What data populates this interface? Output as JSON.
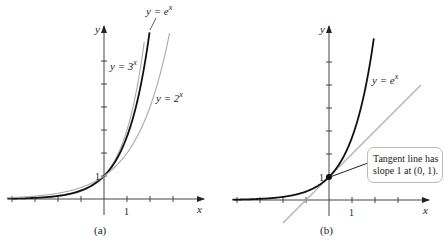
{
  "chart_data": [
    {
      "type": "line",
      "panel_label": "(a)",
      "xlabel": "x",
      "ylabel": "y",
      "x_tick_label": "1",
      "y_tick_label": "1",
      "xlim": [
        -4,
        3
      ],
      "ylim": [
        0,
        6.5
      ],
      "x_ticks": [
        -4,
        -3,
        -2,
        -1,
        1,
        2,
        3
      ],
      "y_ticks": [
        1,
        2,
        3,
        4,
        5,
        6
      ],
      "grid": false,
      "series": [
        {
          "name": "y = 3^x",
          "label_text": "y = 3",
          "label_sup": "x",
          "base": 3,
          "color": "#aaaaaa",
          "x_range": [
            -4.2,
            1.75
          ]
        },
        {
          "name": "y = e^x",
          "label_text": "y = e",
          "label_sup": "x",
          "base": 2.718281828,
          "color": "#111111",
          "x_range": [
            -4.2,
            1.98
          ]
        },
        {
          "name": "y = 2^x",
          "label_text": "y = 2",
          "label_sup": "x",
          "base": 2,
          "color": "#aaaaaa",
          "x_range": [
            -4.2,
            2.85
          ]
        }
      ]
    },
    {
      "type": "line",
      "panel_label": "(b)",
      "xlabel": "x",
      "ylabel": "y",
      "x_tick_label": "1",
      "y_tick_label": "1",
      "xlim": [
        -4,
        3
      ],
      "ylim": [
        0,
        6.5
      ],
      "x_ticks": [
        -4,
        -3,
        -2,
        -1,
        1,
        2,
        3
      ],
      "y_ticks": [
        1,
        2,
        3,
        4,
        5,
        6
      ],
      "grid": false,
      "series": [
        {
          "name": "y = e^x",
          "label_text": "y = e",
          "label_sup": "x",
          "base": 2.718281828,
          "color": "#111111",
          "x_range": [
            -4.2,
            1.95
          ]
        },
        {
          "name": "tangent y = x + 1",
          "slope": 1,
          "intercept": 1,
          "color": "#aaaaaa",
          "x_range": [
            -2,
            4
          ]
        }
      ],
      "point": {
        "x": 0,
        "y": 1
      },
      "annotation": {
        "line1": "Tangent line has",
        "line2": "slope 1 at (0, 1)."
      }
    }
  ]
}
